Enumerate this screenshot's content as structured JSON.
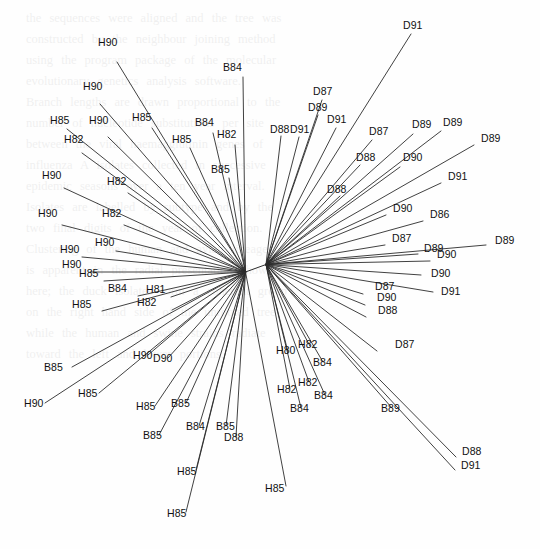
{
  "figure": {
    "type": "unrooted-phylogenetic-tree",
    "title": "",
    "background_color": "#fefefe",
    "line_color": "#2b2b2b",
    "label_color": "#111111",
    "width": 540,
    "height": 549,
    "hub_left": {
      "x": 245.5,
      "y": 272.0
    },
    "hub_right": {
      "x": 266.0,
      "y": 264.5
    }
  },
  "chart_data": {
    "type": "scatter",
    "title": "",
    "xlabel": "",
    "ylabel": "",
    "leaf_count": 62,
    "taxa_prefixes": [
      "H",
      "B",
      "D"
    ],
    "leaves": [
      {
        "label": "H90",
        "hub": "L",
        "tip_x": 117,
        "tip_y": 62,
        "lx": 98,
        "ly": 43
      },
      {
        "label": "H90",
        "hub": "L",
        "tip_x": 100,
        "tip_y": 104,
        "lx": 83,
        "ly": 87
      },
      {
        "label": "H85",
        "hub": "L",
        "tip_x": 67,
        "tip_y": 129,
        "lx": 50,
        "ly": 121
      },
      {
        "label": "H90",
        "hub": "L",
        "tip_x": 108,
        "tip_y": 137,
        "lx": 89,
        "ly": 121
      },
      {
        "label": "H85",
        "hub": "L",
        "tip_x": 152,
        "tip_y": 128,
        "lx": 132,
        "ly": 118
      },
      {
        "label": "H82",
        "hub": "L",
        "tip_x": 82,
        "tip_y": 153,
        "lx": 64,
        "ly": 140
      },
      {
        "label": "H85",
        "hub": "L",
        "tip_x": 190,
        "tip_y": 148,
        "lx": 172,
        "ly": 140
      },
      {
        "label": "B84",
        "hub": "L",
        "tip_x": 213,
        "tip_y": 133,
        "lx": 195,
        "ly": 123
      },
      {
        "label": "H82",
        "hub": "L",
        "tip_x": 235,
        "tip_y": 145,
        "lx": 217,
        "ly": 135
      },
      {
        "label": "B85",
        "hub": "L",
        "tip_x": 229,
        "tip_y": 178,
        "lx": 211,
        "ly": 170
      },
      {
        "label": "B84",
        "hub": "L",
        "tip_x": 243,
        "tip_y": 77,
        "lx": 223,
        "ly": 68
      },
      {
        "label": "H90",
        "hub": "L",
        "tip_x": 64,
        "tip_y": 188,
        "lx": 42,
        "ly": 176
      },
      {
        "label": "H82",
        "hub": "L",
        "tip_x": 128,
        "tip_y": 193,
        "lx": 107,
        "ly": 182
      },
      {
        "label": "H90",
        "hub": "L",
        "tip_x": 62,
        "tip_y": 225,
        "lx": 38,
        "ly": 214
      },
      {
        "label": "H82",
        "hub": "L",
        "tip_x": 124,
        "tip_y": 225,
        "lx": 102,
        "ly": 214
      },
      {
        "label": "H90",
        "hub": "L",
        "tip_x": 116,
        "tip_y": 251,
        "lx": 95,
        "ly": 243
      },
      {
        "label": "H90",
        "hub": "L",
        "tip_x": 82,
        "tip_y": 257,
        "lx": 60,
        "ly": 250
      },
      {
        "label": "H90",
        "hub": "L",
        "tip_x": 90,
        "tip_y": 272,
        "lx": 62,
        "ly": 265
      },
      {
        "label": "H85",
        "hub": "L",
        "tip_x": 104,
        "tip_y": 281,
        "lx": 79,
        "ly": 274
      },
      {
        "label": "B84",
        "hub": "L",
        "tip_x": 138,
        "tip_y": 296,
        "lx": 108,
        "ly": 289
      },
      {
        "label": "H81",
        "hub": "L",
        "tip_x": 171,
        "tip_y": 297,
        "lx": 146,
        "ly": 290
      },
      {
        "label": "H82",
        "hub": "L",
        "tip_x": 172,
        "tip_y": 310,
        "lx": 137,
        "ly": 303
      },
      {
        "label": "H85",
        "hub": "L",
        "tip_x": 102,
        "tip_y": 311,
        "lx": 72,
        "ly": 305
      },
      {
        "label": "B85",
        "hub": "L",
        "tip_x": 72,
        "tip_y": 367,
        "lx": 44,
        "ly": 368
      },
      {
        "label": "H90",
        "hub": "L",
        "tip_x": 148,
        "tip_y": 355,
        "lx": 133,
        "ly": 356
      },
      {
        "label": "D90",
        "hub": "L",
        "tip_x": 168,
        "tip_y": 358,
        "lx": 153,
        "ly": 359
      },
      {
        "label": "H90",
        "hub": "L",
        "tip_x": 45,
        "tip_y": 403,
        "lx": 24,
        "ly": 404
      },
      {
        "label": "H85",
        "hub": "L",
        "tip_x": 99,
        "tip_y": 393,
        "lx": 78,
        "ly": 394
      },
      {
        "label": "H85",
        "hub": "L",
        "tip_x": 155,
        "tip_y": 406,
        "lx": 136,
        "ly": 407
      },
      {
        "label": "B85",
        "hub": "L",
        "tip_x": 186,
        "tip_y": 403,
        "lx": 171,
        "ly": 404
      },
      {
        "label": "B85",
        "hub": "L",
        "tip_x": 159,
        "tip_y": 435,
        "lx": 143,
        "ly": 436
      },
      {
        "label": "B84",
        "hub": "L",
        "tip_x": 199,
        "tip_y": 426,
        "lx": 186,
        "ly": 427
      },
      {
        "label": "B85",
        "hub": "L",
        "tip_x": 226,
        "tip_y": 426,
        "lx": 216,
        "ly": 427
      },
      {
        "label": "D88",
        "hub": "L",
        "tip_x": 236,
        "tip_y": 437,
        "lx": 224,
        "ly": 438
      },
      {
        "label": "H85",
        "hub": "L",
        "tip_x": 196,
        "tip_y": 470,
        "lx": 177,
        "ly": 472
      },
      {
        "label": "H85",
        "hub": "L",
        "tip_x": 186,
        "tip_y": 512,
        "lx": 167,
        "ly": 514
      },
      {
        "label": "H85",
        "hub": "L",
        "tip_x": 286,
        "tip_y": 486,
        "lx": 265,
        "ly": 489
      },
      {
        "label": "H80",
        "hub": "R",
        "tip_x": 288,
        "tip_y": 352,
        "lx": 276,
        "ly": 351
      },
      {
        "label": "H82",
        "hub": "R",
        "tip_x": 310,
        "tip_y": 346,
        "lx": 298,
        "ly": 345
      },
      {
        "label": "B84",
        "hub": "R",
        "tip_x": 323,
        "tip_y": 362,
        "lx": 313,
        "ly": 363
      },
      {
        "label": "H82",
        "hub": "R",
        "tip_x": 309,
        "tip_y": 382,
        "lx": 298,
        "ly": 383
      },
      {
        "label": "H82",
        "hub": "R",
        "tip_x": 290,
        "tip_y": 389,
        "lx": 277,
        "ly": 390
      },
      {
        "label": "B84",
        "hub": "R",
        "tip_x": 325,
        "tip_y": 395,
        "lx": 314,
        "ly": 396
      },
      {
        "label": "B84",
        "hub": "R",
        "tip_x": 301,
        "tip_y": 408,
        "lx": 290,
        "ly": 409
      },
      {
        "label": "B89",
        "hub": "R",
        "tip_x": 392,
        "tip_y": 408,
        "lx": 381,
        "ly": 409
      },
      {
        "label": "D88",
        "hub": "R",
        "tip_x": 456,
        "tip_y": 457,
        "lx": 462,
        "ly": 452
      },
      {
        "label": "D91",
        "hub": "R",
        "tip_x": 455,
        "tip_y": 470,
        "lx": 461,
        "ly": 466
      },
      {
        "label": "D87",
        "hub": "R",
        "tip_x": 377,
        "tip_y": 351,
        "lx": 395,
        "ly": 345
      },
      {
        "label": "D88",
        "hub": "R",
        "tip_x": 366,
        "tip_y": 317,
        "lx": 378,
        "ly": 311
      },
      {
        "label": "D90",
        "hub": "R",
        "tip_x": 365,
        "tip_y": 305,
        "lx": 377,
        "ly": 298
      },
      {
        "label": "D87",
        "hub": "R",
        "tip_x": 363,
        "tip_y": 294,
        "lx": 375,
        "ly": 287
      },
      {
        "label": "D91",
        "hub": "R",
        "tip_x": 433,
        "tip_y": 292,
        "lx": 441,
        "ly": 292
      },
      {
        "label": "D90",
        "hub": "R",
        "tip_x": 421,
        "tip_y": 275,
        "lx": 431,
        "ly": 274
      },
      {
        "label": "D90",
        "hub": "R",
        "tip_x": 430,
        "tip_y": 261,
        "lx": 437,
        "ly": 255
      },
      {
        "label": "D89",
        "hub": "R",
        "tip_x": 486,
        "tip_y": 245,
        "lx": 495,
        "ly": 241
      },
      {
        "label": "D89",
        "hub": "R",
        "tip_x": 418,
        "tip_y": 254,
        "lx": 424,
        "ly": 249
      },
      {
        "label": "D87",
        "hub": "R",
        "tip_x": 385,
        "tip_y": 245,
        "lx": 392,
        "ly": 239
      },
      {
        "label": "D86",
        "hub": "R",
        "tip_x": 423,
        "tip_y": 221,
        "lx": 430,
        "ly": 215
      },
      {
        "label": "D90",
        "hub": "R",
        "tip_x": 386,
        "tip_y": 215,
        "lx": 393,
        "ly": 209
      },
      {
        "label": "D91",
        "hub": "R",
        "tip_x": 441,
        "tip_y": 183,
        "lx": 448,
        "ly": 177
      },
      {
        "label": "D89",
        "hub": "R",
        "tip_x": 474,
        "tip_y": 145,
        "lx": 481,
        "ly": 139
      },
      {
        "label": "D89",
        "hub": "R",
        "tip_x": 441,
        "tip_y": 131,
        "lx": 443,
        "ly": 123
      },
      {
        "label": "D89",
        "hub": "R",
        "tip_x": 413,
        "tip_y": 134,
        "lx": 412,
        "ly": 125
      },
      {
        "label": "D90",
        "hub": "R",
        "tip_x": 400,
        "tip_y": 167,
        "lx": 403,
        "ly": 158
      },
      {
        "label": "D88",
        "hub": "R",
        "tip_x": 360,
        "tip_y": 165,
        "lx": 356,
        "ly": 158
      },
      {
        "label": "D87",
        "hub": "R",
        "tip_x": 372,
        "tip_y": 140,
        "lx": 369,
        "ly": 132
      },
      {
        "label": "D88",
        "hub": "R",
        "tip_x": 340,
        "tip_y": 196,
        "lx": 327,
        "ly": 190
      },
      {
        "label": "D87",
        "hub": "R",
        "tip_x": 322,
        "tip_y": 100,
        "lx": 313,
        "ly": 92
      },
      {
        "label": "D91",
        "hub": "R",
        "tip_x": 336,
        "tip_y": 128,
        "lx": 327,
        "ly": 120
      },
      {
        "label": "D89",
        "hub": "R",
        "tip_x": 318,
        "tip_y": 115,
        "lx": 308,
        "ly": 108
      },
      {
        "label": "D91",
        "hub": "R",
        "tip_x": 299,
        "tip_y": 137,
        "lx": 290,
        "ly": 130
      },
      {
        "label": "D88",
        "hub": "R",
        "tip_x": 281,
        "tip_y": 136,
        "lx": 270,
        "ly": 130
      },
      {
        "label": "D91",
        "hub": "R",
        "tip_x": 411,
        "tip_y": 34,
        "lx": 403,
        "ly": 26
      }
    ]
  },
  "bleed_text": {
    "lines": [
      "the sequences were aligned and the tree was",
      "constructed by the neighbour joining method",
      "using the program package of the molecular",
      "evolutionary genetics analysis software.",
      "Branch lengths are drawn proportional to the",
      "number of nucleotide substitutions per site",
      "between the viral haemagglutinin genes of",
      "influenza A isolates collected in successive",
      "epidemic seasons over a ten year interval.",
      "",
      "Isolates are labelled by subtype and by the",
      "two final digits of the year of collection.",
      "Clustering of the human and avian lineages",
      "is apparent in the radial presentation shown",
      "here; the duck isolates form a coherent group",
      "on the right hand side of the unrooted tree",
      "while the human and swine strains radiate",
      "toward the left and lower portions."
    ]
  }
}
